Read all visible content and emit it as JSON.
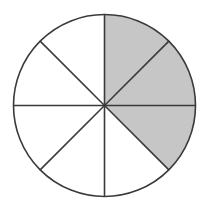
{
  "diagram": {
    "type": "fraction-circle",
    "total_parts": 8,
    "shaded_parts": 3,
    "fraction_shaded": "3/8",
    "center": [
      104.5,
      105.5
    ],
    "radius": 91,
    "start_angle_deg": -90,
    "direction": "clockwise",
    "shaded_sector_indices": [
      0,
      1,
      2
    ],
    "colors": {
      "shaded": "#c6c6c6",
      "unshaded": "#ffffff",
      "stroke": "#3a3a3a"
    },
    "stroke_width": 1.6
  }
}
